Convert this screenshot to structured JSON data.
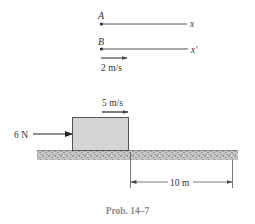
{
  "reference_lines": [
    {
      "point_label": "A",
      "axis_label": "x"
    },
    {
      "point_label": "B",
      "axis_label": "x'"
    }
  ],
  "frame_velocity": {
    "label": "2 m/s"
  },
  "block": {
    "velocity_label": "5 m/s",
    "force_label": "6 N"
  },
  "dimension": {
    "label": "10 m"
  },
  "caption": "Prob. 14–7",
  "colors": {
    "block_fill": "#d4d4d4",
    "line": "#444444",
    "ground": "#9a9a9a"
  }
}
